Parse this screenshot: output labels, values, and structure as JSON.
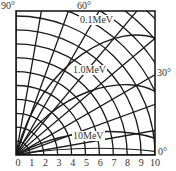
{
  "figure": {
    "angle_labels": [
      {
        "text": "90°",
        "x": 1,
        "y": 1
      },
      {
        "text": "60°",
        "x": 77,
        "y": 1
      },
      {
        "text": "30°",
        "x": 157,
        "y": 68
      },
      {
        "text": "0°",
        "x": 158,
        "y": 147
      }
    ],
    "energy_labels": [
      {
        "text": "0.1MeV",
        "x": 79,
        "y": 15
      },
      {
        "text": "1.0MeV",
        "x": 72,
        "y": 65
      },
      {
        "text": "10MeV",
        "x": 72,
        "y": 131
      }
    ],
    "x_ticks": [
      "0",
      "1",
      "2",
      "3",
      "4",
      "5",
      "6",
      "7",
      "8",
      "9",
      "10"
    ]
  },
  "chart_data": {
    "type": "polar-diagram",
    "title": "",
    "x_tick_labels": [
      "0",
      "1",
      "2",
      "3",
      "4",
      "5",
      "6",
      "7",
      "8",
      "9",
      "10"
    ],
    "angle_labels": [
      "90°",
      "60°",
      "30°",
      "0°"
    ],
    "curves": [
      "0.1MeV",
      "1.0MeV",
      "10MeV"
    ],
    "xlim": [
      0,
      10
    ],
    "grid": true
  }
}
